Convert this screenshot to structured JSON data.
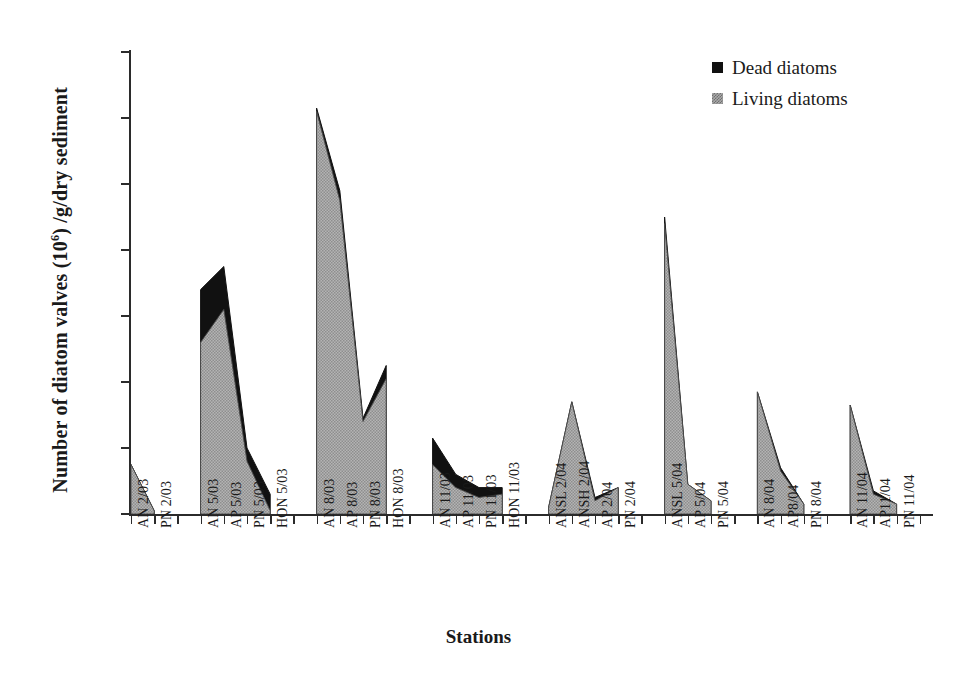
{
  "chart_data": {
    "type": "area",
    "title": "",
    "xlabel": "Stations",
    "ylabel": "Number of diatom valves (10⁶) /g/dry sediment",
    "ylabel_prefix": "Number of diatom valves (10",
    "ylabel_sup": "6",
    "ylabel_suffix": ") /g/dry sediment",
    "ylim": [
      0,
      140
    ],
    "yticks": [
      0,
      20,
      40,
      60,
      80,
      100,
      120,
      140
    ],
    "grid": false,
    "stacked": true,
    "legend_position": "top-right",
    "legend": [
      "Dead diatoms",
      "Living diatoms"
    ],
    "colors": {
      "dead": "#111111",
      "living": "#a9a9a9",
      "axis": "#2b2b2b",
      "text": "#1a1a1a"
    },
    "categories": [
      "AN 2/03",
      "PN 2/03",
      "AN 5/03",
      "AP 5/03",
      "PN 5/03",
      "HON 5/03",
      "AN 8/03",
      "AP 8/03",
      "PN 8/03",
      "HON 8/03",
      "AN 11/03",
      "AP 11/03",
      "PN 11/03",
      "HON 11/03",
      "ANSL 2/04",
      "ANSH 2/04",
      "AP 2/04",
      "PN 2/04",
      "ANSL 5/04",
      "AP 5/04",
      "PN 5/04",
      "AN 8/04",
      "AP8/04",
      "PN 8/04",
      "AN 11/04",
      "AP11/04",
      "PN 11/04"
    ],
    "groups": [
      {
        "label": "2/03",
        "count": 2
      },
      {
        "label": "5/03",
        "count": 4
      },
      {
        "label": "8/03",
        "count": 4
      },
      {
        "label": "11/03",
        "count": 4
      },
      {
        "label": "2/04",
        "count": 4
      },
      {
        "label": "5/04",
        "count": 3
      },
      {
        "label": "8/04",
        "count": 3
      },
      {
        "label": "11/04",
        "count": 3
      }
    ],
    "series": [
      {
        "name": "Living diatoms",
        "values": [
          15,
          1,
          52,
          62,
          16,
          1,
          122,
          95,
          28,
          41,
          15,
          8,
          5,
          6,
          2,
          34,
          4,
          8,
          88,
          9,
          4,
          37,
          13,
          3,
          33,
          6,
          3
        ]
      },
      {
        "name": "Dead diatoms",
        "values": [
          0,
          0,
          16,
          13,
          4,
          5,
          1,
          3,
          1,
          4,
          8,
          4,
          3,
          2,
          0,
          0,
          1,
          0,
          2,
          0,
          0,
          0,
          1,
          0,
          0,
          1,
          0
        ]
      }
    ],
    "totals": [
      15,
      1,
      68,
      75,
      20,
      6,
      123,
      98,
      29,
      45,
      23,
      12,
      8,
      8,
      2,
      34,
      5,
      8,
      90,
      9,
      4,
      37,
      14,
      3,
      33,
      7,
      3
    ]
  }
}
